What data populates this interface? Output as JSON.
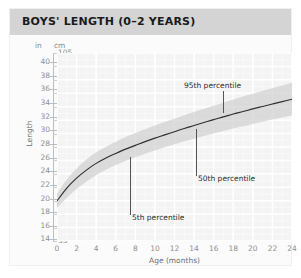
{
  "header": {
    "title": "BOYS' LENGTH (0–2 YEARS)"
  },
  "axes": {
    "unit_left": "in",
    "unit_right": "cm",
    "y_title": "Length",
    "x_title": "Age (months)"
  },
  "annotations": {
    "p95": "95th percentile",
    "p50": "50th percentile",
    "p5": "5th percentile"
  },
  "colors": {
    "header_bar": "#d4d4d4",
    "card": "#fbfbfb",
    "plot_background": "#f4f4f4",
    "gridline": "#ffffff",
    "band": "#c9c9c9",
    "median_line": "#2f2f2f",
    "tick_text": "#8f8f8f",
    "title_text": "#1b1b1b"
  },
  "chart_data": {
    "type": "line",
    "title": "BOYS' LENGTH (0–2 YEARS)",
    "subtitle": "",
    "xlabel": "Age (months)",
    "ylabel": "Length",
    "grid": true,
    "legend_position": "inline-annotations",
    "x": [
      0,
      1,
      2,
      3,
      4,
      5,
      6,
      7,
      8,
      9,
      10,
      11,
      12,
      13,
      14,
      15,
      16,
      17,
      18,
      19,
      20,
      21,
      22,
      23,
      24
    ],
    "xlim": [
      0,
      24
    ],
    "xticks": [
      0,
      2,
      4,
      6,
      8,
      10,
      12,
      14,
      16,
      18,
      20,
      22,
      24
    ],
    "y_axis_primary": {
      "unit": "cm",
      "ylim": [
        35,
        105
      ],
      "yticks": [
        35,
        40,
        45,
        50,
        55,
        60,
        65,
        70,
        75,
        80,
        85,
        90,
        95,
        100,
        105
      ]
    },
    "y_axis_secondary": {
      "unit": "in",
      "ylim": [
        13.8,
        41.3
      ],
      "yticks": [
        14,
        16,
        18,
        20,
        22,
        24,
        26,
        28,
        30,
        32,
        34,
        36,
        38,
        40
      ]
    },
    "series": [
      {
        "name": "5th percentile",
        "unit": "cm",
        "values": [
          47.3,
          51.1,
          54.4,
          57.1,
          59.5,
          61.5,
          63.3,
          64.8,
          66.2,
          67.5,
          68.7,
          69.9,
          71.0,
          72.1,
          73.1,
          74.1,
          75.0,
          76.0,
          76.9,
          77.7,
          78.6,
          79.4,
          80.2,
          81.0,
          81.7
        ]
      },
      {
        "name": "50th percentile",
        "unit": "cm",
        "values": [
          49.9,
          54.7,
          58.4,
          61.4,
          63.9,
          65.9,
          67.6,
          69.2,
          70.6,
          72.0,
          73.3,
          74.5,
          75.7,
          76.9,
          78.0,
          79.1,
          80.2,
          81.2,
          82.3,
          83.2,
          84.2,
          85.1,
          86.0,
          86.9,
          87.8
        ]
      },
      {
        "name": "95th percentile",
        "unit": "cm",
        "values": [
          52.7,
          57.9,
          62.0,
          65.3,
          68.0,
          70.1,
          72.0,
          73.7,
          75.2,
          76.6,
          78.0,
          79.3,
          80.5,
          81.8,
          83.0,
          84.2,
          85.4,
          86.5,
          87.7,
          88.8,
          89.8,
          90.9,
          91.9,
          92.9,
          93.9
        ]
      }
    ],
    "band": {
      "lower_series": "5th percentile",
      "upper_series": "95th percentile",
      "fill": "#c9c9c9"
    },
    "annotations": [
      {
        "text": "95th percentile",
        "points_to": "95th percentile",
        "at_month": 21
      },
      {
        "text": "50th percentile",
        "points_to": "50th percentile",
        "at_month": 14.2
      },
      {
        "text": "5th percentile",
        "points_to": "5th percentile",
        "at_month": 7.4
      }
    ]
  },
  "ticks": {
    "inches": [
      "40",
      "38",
      "36",
      "34",
      "32",
      "30",
      "28",
      "26",
      "24",
      "22",
      "20",
      "18",
      "16",
      "14"
    ],
    "cm": [
      "105",
      "100",
      "95",
      "90",
      "85",
      "80",
      "75",
      "70",
      "65",
      "60",
      "55",
      "50",
      "45",
      "40",
      "35"
    ],
    "months": [
      "0",
      "2",
      "4",
      "6",
      "8",
      "10",
      "12",
      "14",
      "16",
      "18",
      "20",
      "22",
      "24"
    ]
  }
}
